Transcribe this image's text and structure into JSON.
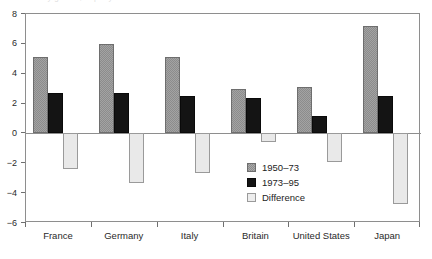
{
  "figure": {
    "caption_remnant": "Productivity growth, % per year"
  },
  "chart_data": {
    "type": "bar",
    "title": "",
    "subtitle": "",
    "xlabel": "",
    "ylabel": "",
    "categories": [
      "France",
      "Germany",
      "Italy",
      "Britain",
      "United States",
      "Japan"
    ],
    "series": [
      {
        "name": "1950–73",
        "color": "#8c8c8c",
        "values": [
          5.1,
          6.0,
          5.1,
          2.95,
          3.1,
          7.2
        ]
      },
      {
        "name": "1973–95",
        "color": "#141414",
        "values": [
          2.7,
          2.7,
          2.5,
          2.4,
          1.2,
          2.5
        ]
      },
      {
        "name": "Difference",
        "color": "#e9e9e9",
        "values": [
          -2.4,
          -3.3,
          -2.65,
          -0.55,
          -1.9,
          -4.7
        ]
      }
    ],
    "ylim": [
      -6,
      8
    ],
    "yticks": [
      8,
      6,
      4,
      2,
      0,
      -2,
      -4,
      -6
    ],
    "ytick_labels": [
      "8",
      "6",
      "4",
      "2",
      "0",
      "−2",
      "−4",
      "−6"
    ],
    "grid": false,
    "zero_line": true,
    "legend_position": "inside lower-right"
  }
}
